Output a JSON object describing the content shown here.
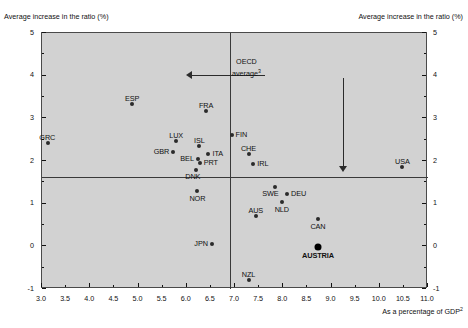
{
  "chart_data": {
    "type": "scatter",
    "title": "",
    "ylabel_left": "Average increase in the ratio (%)",
    "ylabel_right": "Average increase in the ratio (%)",
    "xlabel": "As a percentage of GDP",
    "xlabel_sup": "2",
    "xlim": [
      3.0,
      11.0
    ],
    "ylim": [
      -1,
      5
    ],
    "xticks": [
      "3.0",
      "3.5",
      "4.0",
      "4.5",
      "5.0",
      "5.5",
      "6.0",
      "6.5",
      "7.0",
      "7.5",
      "8.0",
      "8.5",
      "9.0",
      "9.5",
      "10.0",
      "10.5",
      "11.0"
    ],
    "xtick_values": [
      3.0,
      3.5,
      4.0,
      4.5,
      5.0,
      5.5,
      6.0,
      6.5,
      7.0,
      7.5,
      8.0,
      8.5,
      9.0,
      9.5,
      10.0,
      10.5,
      11.0
    ],
    "yticks": [
      "5",
      "4",
      "3",
      "2",
      "1",
      "0",
      "-1"
    ],
    "ytick_values": [
      5,
      4,
      3,
      2,
      1,
      0,
      -1
    ],
    "grid": false,
    "legend": "none",
    "annotation": {
      "text_line1": "OECD",
      "text_line2": "average",
      "text_sup": "3",
      "vertical_reference_x": 6.9,
      "horizontal_reference_y": 1.63
    },
    "points": [
      {
        "label": "GRC",
        "x": 3.13,
        "y": 2.42,
        "label_pos": "above-left",
        "highlight": false
      },
      {
        "label": "ESP",
        "x": 4.87,
        "y": 3.33,
        "label_pos": "above",
        "highlight": false
      },
      {
        "label": "FRA",
        "x": 6.4,
        "y": 3.17,
        "label_pos": "above",
        "highlight": false
      },
      {
        "label": "LUX",
        "x": 5.78,
        "y": 2.47,
        "label_pos": "above",
        "highlight": false
      },
      {
        "label": "ISL",
        "x": 6.26,
        "y": 2.35,
        "label_pos": "above",
        "highlight": false
      },
      {
        "label": "GBR",
        "x": 5.72,
        "y": 2.2,
        "label_pos": "left",
        "highlight": false
      },
      {
        "label": "BEL",
        "x": 6.23,
        "y": 2.05,
        "label_pos": "left",
        "highlight": false
      },
      {
        "label": "ITA",
        "x": 6.45,
        "y": 2.17,
        "label_pos": "right",
        "highlight": false
      },
      {
        "label": "PRT",
        "x": 6.27,
        "y": 1.95,
        "label_pos": "right",
        "highlight": false
      },
      {
        "label": "DNK",
        "x": 6.2,
        "y": 1.78,
        "label_pos": "below-left",
        "highlight": false
      },
      {
        "label": "FIN",
        "x": 6.93,
        "y": 2.6,
        "label_pos": "right",
        "highlight": false
      },
      {
        "label": "CHE",
        "x": 7.28,
        "y": 2.16,
        "label_pos": "above",
        "highlight": false
      },
      {
        "label": "IRL",
        "x": 7.38,
        "y": 1.92,
        "label_pos": "right",
        "highlight": false
      },
      {
        "label": "USA",
        "x": 10.47,
        "y": 1.87,
        "label_pos": "above",
        "highlight": false
      },
      {
        "label": "NOR",
        "x": 6.22,
        "y": 1.3,
        "label_pos": "below",
        "highlight": false
      },
      {
        "label": "SWE",
        "x": 7.82,
        "y": 1.4,
        "label_pos": "below-left",
        "highlight": false
      },
      {
        "label": "DEU",
        "x": 8.08,
        "y": 1.22,
        "label_pos": "right",
        "highlight": false
      },
      {
        "label": "NLD",
        "x": 7.97,
        "y": 1.05,
        "label_pos": "below",
        "highlight": false
      },
      {
        "label": "AUS",
        "x": 7.43,
        "y": 0.72,
        "label_pos": "above",
        "highlight": false
      },
      {
        "label": "CAN",
        "x": 8.72,
        "y": 0.65,
        "label_pos": "below",
        "highlight": false
      },
      {
        "label": "JPN",
        "x": 6.52,
        "y": 0.05,
        "label_pos": "left",
        "highlight": false
      },
      {
        "label": "AUSTRIA",
        "x": 8.72,
        "y": -0.02,
        "label_pos": "below",
        "highlight": true
      },
      {
        "label": "NZL",
        "x": 7.28,
        "y": -0.78,
        "label_pos": "above",
        "highlight": false
      }
    ]
  }
}
